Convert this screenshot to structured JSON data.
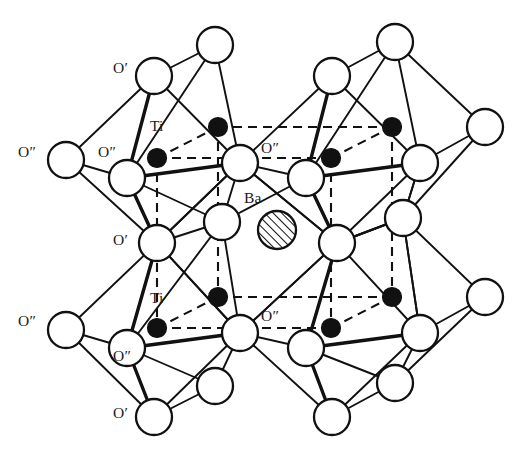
{
  "figure": {
    "type": "crystal-structure-diagram",
    "compound": "BaTiO3",
    "structure_name": "perovskite",
    "background_color": "#ffffff",
    "line_color": "#111111"
  },
  "legend": {
    "barium_label": "Ba",
    "titanium_label": "Ti",
    "oxygen_prime_label": "O′",
    "oxygen_double_prime_label": "O″"
  },
  "species": {
    "oxygen": {
      "name": "oxygen",
      "render": "open-circle",
      "fill": "#ffffff",
      "stroke": "#111111",
      "radius": 18
    },
    "titanium": {
      "name": "titanium",
      "render": "filled-circle",
      "fill": "#111111",
      "stroke": "#111111",
      "radius": 9.5
    },
    "barium": {
      "name": "barium",
      "render": "hatched-circle",
      "fill": "diagonal-hatch",
      "stroke": "#111111",
      "radius": 19
    }
  },
  "labels": [
    {
      "id": "o-prime-top-left",
      "text": "O′",
      "x": 113,
      "y": 60,
      "species": "oxygen"
    },
    {
      "id": "o-dprime-far-left",
      "text": "O″",
      "x": 18,
      "y": 144,
      "species": "oxygen"
    },
    {
      "id": "o-dprime-left-inner",
      "text": "O″",
      "x": 98,
      "y": 144,
      "species": "oxygen"
    },
    {
      "id": "ti-upper",
      "text": "Ti",
      "x": 150,
      "y": 118,
      "species": "titanium"
    },
    {
      "id": "o-dprime-center-upper",
      "text": "O″",
      "x": 261,
      "y": 140,
      "species": "oxygen"
    },
    {
      "id": "ba-center",
      "text": "Ba",
      "x": 244,
      "y": 190,
      "species": "barium"
    },
    {
      "id": "o-prime-left-middle",
      "text": "O′",
      "x": 113,
      "y": 232,
      "species": "oxygen"
    },
    {
      "id": "ti-lower",
      "text": "Ti",
      "x": 150,
      "y": 290,
      "species": "titanium"
    },
    {
      "id": "o-dprime-far-left-low",
      "text": "O″",
      "x": 18,
      "y": 313,
      "species": "oxygen"
    },
    {
      "id": "o-dprime-center-lower",
      "text": "O″",
      "x": 261,
      "y": 308,
      "species": "oxygen"
    },
    {
      "id": "o-dprime-left-low",
      "text": "O″",
      "x": 113,
      "y": 348,
      "species": "oxygen"
    },
    {
      "id": "o-prime-bottom-left",
      "text": "O′",
      "x": 113,
      "y": 405,
      "species": "oxygen"
    }
  ],
  "atoms": {
    "oxygen_positions": [
      {
        "id": "o1",
        "x": 215,
        "y": 45
      },
      {
        "id": "o2",
        "x": 395,
        "y": 42
      },
      {
        "id": "o3",
        "x": 154,
        "y": 76
      },
      {
        "id": "o4",
        "x": 332,
        "y": 76
      },
      {
        "id": "o5",
        "x": 66,
        "y": 160
      },
      {
        "id": "o6",
        "x": 485,
        "y": 127
      },
      {
        "id": "o7",
        "x": 127,
        "y": 178
      },
      {
        "id": "o8",
        "x": 240,
        "y": 163
      },
      {
        "id": "o9",
        "x": 306,
        "y": 178
      },
      {
        "id": "o10",
        "x": 420,
        "y": 163
      },
      {
        "id": "o11",
        "x": 222,
        "y": 222
      },
      {
        "id": "o12",
        "x": 403,
        "y": 218
      },
      {
        "id": "o13",
        "x": 157,
        "y": 243
      },
      {
        "id": "o14",
        "x": 337,
        "y": 243
      },
      {
        "id": "o15",
        "x": 66,
        "y": 330
      },
      {
        "id": "o16",
        "x": 485,
        "y": 297
      },
      {
        "id": "o17",
        "x": 127,
        "y": 348
      },
      {
        "id": "o18",
        "x": 240,
        "y": 333
      },
      {
        "id": "o19",
        "x": 306,
        "y": 348
      },
      {
        "id": "o20",
        "x": 420,
        "y": 333
      },
      {
        "id": "o21",
        "x": 215,
        "y": 386
      },
      {
        "id": "o22",
        "x": 395,
        "y": 383
      },
      {
        "id": "o23",
        "x": 154,
        "y": 417
      },
      {
        "id": "o24",
        "x": 332,
        "y": 417
      }
    ],
    "titanium_positions": [
      {
        "id": "ti1",
        "x": 157,
        "y": 158
      },
      {
        "id": "ti2",
        "x": 218,
        "y": 127
      },
      {
        "id": "ti3",
        "x": 331,
        "y": 158
      },
      {
        "id": "ti4",
        "x": 392,
        "y": 127
      },
      {
        "id": "ti5",
        "x": 157,
        "y": 328
      },
      {
        "id": "ti6",
        "x": 218,
        "y": 297
      },
      {
        "id": "ti7",
        "x": 331,
        "y": 328
      },
      {
        "id": "ti8",
        "x": 392,
        "y": 297
      }
    ],
    "barium_positions": [
      {
        "id": "ba1",
        "x": 277,
        "y": 230
      }
    ]
  }
}
